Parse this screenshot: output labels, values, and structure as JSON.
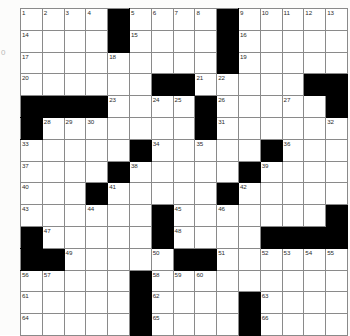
{
  "puzzle": {
    "title": "Crossword Puzzle Grid",
    "size": {
      "rows": 15,
      "cols": 15
    },
    "colors": {
      "block": "#000000",
      "cell": "#ffffff",
      "grid_line": "#8a8a8a",
      "number_text": "#2b2b2b",
      "page_background": "#fcfcfb"
    },
    "margin_note": "0",
    "grid": [
      [
        {
          "block": false,
          "num": "1"
        },
        {
          "block": false,
          "num": "2"
        },
        {
          "block": false,
          "num": "3"
        },
        {
          "block": false,
          "num": "4"
        },
        {
          "block": true,
          "num": ""
        },
        {
          "block": false,
          "num": "5"
        },
        {
          "block": false,
          "num": "6"
        },
        {
          "block": false,
          "num": "7"
        },
        {
          "block": false,
          "num": "8"
        },
        {
          "block": true,
          "num": ""
        },
        {
          "block": false,
          "num": "9"
        },
        {
          "block": false,
          "num": "10"
        },
        {
          "block": false,
          "num": "11"
        },
        {
          "block": false,
          "num": "12"
        },
        {
          "block": false,
          "num": "13"
        }
      ],
      [
        {
          "block": false,
          "num": "14"
        },
        {
          "block": false,
          "num": ""
        },
        {
          "block": false,
          "num": ""
        },
        {
          "block": false,
          "num": ""
        },
        {
          "block": true,
          "num": ""
        },
        {
          "block": false,
          "num": "15"
        },
        {
          "block": false,
          "num": ""
        },
        {
          "block": false,
          "num": ""
        },
        {
          "block": false,
          "num": ""
        },
        {
          "block": true,
          "num": ""
        },
        {
          "block": false,
          "num": "16"
        },
        {
          "block": false,
          "num": ""
        },
        {
          "block": false,
          "num": ""
        },
        {
          "block": false,
          "num": ""
        },
        {
          "block": false,
          "num": ""
        }
      ],
      [
        {
          "block": false,
          "num": "17"
        },
        {
          "block": false,
          "num": ""
        },
        {
          "block": false,
          "num": ""
        },
        {
          "block": false,
          "num": ""
        },
        {
          "block": false,
          "num": "18"
        },
        {
          "block": false,
          "num": ""
        },
        {
          "block": false,
          "num": ""
        },
        {
          "block": false,
          "num": ""
        },
        {
          "block": false,
          "num": ""
        },
        {
          "block": true,
          "num": ""
        },
        {
          "block": false,
          "num": "19"
        },
        {
          "block": false,
          "num": ""
        },
        {
          "block": false,
          "num": ""
        },
        {
          "block": false,
          "num": ""
        },
        {
          "block": false,
          "num": ""
        }
      ],
      [
        {
          "block": false,
          "num": "20"
        },
        {
          "block": false,
          "num": ""
        },
        {
          "block": false,
          "num": ""
        },
        {
          "block": false,
          "num": ""
        },
        {
          "block": false,
          "num": ""
        },
        {
          "block": false,
          "num": ""
        },
        {
          "block": true,
          "num": ""
        },
        {
          "block": true,
          "num": ""
        },
        {
          "block": false,
          "num": "21"
        },
        {
          "block": false,
          "num": "22"
        },
        {
          "block": false,
          "num": ""
        },
        {
          "block": false,
          "num": ""
        },
        {
          "block": false,
          "num": ""
        },
        {
          "block": true,
          "num": ""
        },
        {
          "block": true,
          "num": ""
        }
      ],
      [
        {
          "block": true,
          "num": ""
        },
        {
          "block": true,
          "num": ""
        },
        {
          "block": true,
          "num": ""
        },
        {
          "block": true,
          "num": ""
        },
        {
          "block": false,
          "num": "23"
        },
        {
          "block": false,
          "num": ""
        },
        {
          "block": false,
          "num": "24"
        },
        {
          "block": false,
          "num": "25"
        },
        {
          "block": true,
          "num": ""
        },
        {
          "block": false,
          "num": "26"
        },
        {
          "block": false,
          "num": ""
        },
        {
          "block": false,
          "num": ""
        },
        {
          "block": false,
          "num": "27"
        },
        {
          "block": false,
          "num": ""
        },
        {
          "block": true,
          "num": ""
        }
      ],
      [
        {
          "block": true,
          "num": ""
        },
        {
          "block": false,
          "num": "28"
        },
        {
          "block": false,
          "num": "29"
        },
        {
          "block": false,
          "num": "30"
        },
        {
          "block": false,
          "num": ""
        },
        {
          "block": false,
          "num": ""
        },
        {
          "block": false,
          "num": ""
        },
        {
          "block": false,
          "num": ""
        },
        {
          "block": true,
          "num": ""
        },
        {
          "block": false,
          "num": "31"
        },
        {
          "block": false,
          "num": ""
        },
        {
          "block": false,
          "num": ""
        },
        {
          "block": false,
          "num": ""
        },
        {
          "block": false,
          "num": ""
        },
        {
          "block": false,
          "num": "32"
        }
      ],
      [
        {
          "block": false,
          "num": "33"
        },
        {
          "block": false,
          "num": ""
        },
        {
          "block": false,
          "num": ""
        },
        {
          "block": false,
          "num": ""
        },
        {
          "block": false,
          "num": ""
        },
        {
          "block": true,
          "num": ""
        },
        {
          "block": false,
          "num": "34"
        },
        {
          "block": false,
          "num": ""
        },
        {
          "block": false,
          "num": "35"
        },
        {
          "block": false,
          "num": ""
        },
        {
          "block": false,
          "num": ""
        },
        {
          "block": true,
          "num": ""
        },
        {
          "block": false,
          "num": "36"
        },
        {
          "block": false,
          "num": ""
        },
        {
          "block": false,
          "num": ""
        }
      ],
      [
        {
          "block": false,
          "num": "37"
        },
        {
          "block": false,
          "num": ""
        },
        {
          "block": false,
          "num": ""
        },
        {
          "block": false,
          "num": ""
        },
        {
          "block": true,
          "num": ""
        },
        {
          "block": false,
          "num": "38"
        },
        {
          "block": false,
          "num": ""
        },
        {
          "block": false,
          "num": ""
        },
        {
          "block": false,
          "num": ""
        },
        {
          "block": false,
          "num": ""
        },
        {
          "block": true,
          "num": ""
        },
        {
          "block": false,
          "num": "39"
        },
        {
          "block": false,
          "num": ""
        },
        {
          "block": false,
          "num": ""
        },
        {
          "block": false,
          "num": ""
        }
      ],
      [
        {
          "block": false,
          "num": "40"
        },
        {
          "block": false,
          "num": ""
        },
        {
          "block": false,
          "num": ""
        },
        {
          "block": true,
          "num": ""
        },
        {
          "block": false,
          "num": "41"
        },
        {
          "block": false,
          "num": ""
        },
        {
          "block": false,
          "num": ""
        },
        {
          "block": false,
          "num": ""
        },
        {
          "block": false,
          "num": ""
        },
        {
          "block": true,
          "num": ""
        },
        {
          "block": false,
          "num": "42"
        },
        {
          "block": false,
          "num": ""
        },
        {
          "block": false,
          "num": ""
        },
        {
          "block": false,
          "num": ""
        },
        {
          "block": false,
          "num": ""
        }
      ],
      [
        {
          "block": false,
          "num": "43"
        },
        {
          "block": false,
          "num": ""
        },
        {
          "block": false,
          "num": ""
        },
        {
          "block": false,
          "num": "44"
        },
        {
          "block": false,
          "num": ""
        },
        {
          "block": false,
          "num": ""
        },
        {
          "block": true,
          "num": ""
        },
        {
          "block": false,
          "num": "45"
        },
        {
          "block": false,
          "num": ""
        },
        {
          "block": false,
          "num": "46"
        },
        {
          "block": false,
          "num": ""
        },
        {
          "block": false,
          "num": ""
        },
        {
          "block": false,
          "num": ""
        },
        {
          "block": false,
          "num": ""
        },
        {
          "block": true,
          "num": ""
        }
      ],
      [
        {
          "block": true,
          "num": ""
        },
        {
          "block": false,
          "num": "47"
        },
        {
          "block": false,
          "num": ""
        },
        {
          "block": false,
          "num": ""
        },
        {
          "block": false,
          "num": ""
        },
        {
          "block": false,
          "num": ""
        },
        {
          "block": true,
          "num": ""
        },
        {
          "block": false,
          "num": "48"
        },
        {
          "block": false,
          "num": ""
        },
        {
          "block": false,
          "num": ""
        },
        {
          "block": false,
          "num": ""
        },
        {
          "block": true,
          "num": ""
        },
        {
          "block": true,
          "num": ""
        },
        {
          "block": true,
          "num": ""
        },
        {
          "block": true,
          "num": ""
        }
      ],
      [
        {
          "block": true,
          "num": ""
        },
        {
          "block": true,
          "num": ""
        },
        {
          "block": false,
          "num": "49"
        },
        {
          "block": false,
          "num": ""
        },
        {
          "block": false,
          "num": ""
        },
        {
          "block": false,
          "num": ""
        },
        {
          "block": false,
          "num": "50"
        },
        {
          "block": true,
          "num": ""
        },
        {
          "block": true,
          "num": ""
        },
        {
          "block": false,
          "num": "51"
        },
        {
          "block": false,
          "num": ""
        },
        {
          "block": false,
          "num": "52"
        },
        {
          "block": false,
          "num": "53"
        },
        {
          "block": false,
          "num": "54"
        },
        {
          "block": false,
          "num": "55"
        }
      ],
      [
        {
          "block": false,
          "num": "56"
        },
        {
          "block": false,
          "num": "57"
        },
        {
          "block": false,
          "num": ""
        },
        {
          "block": false,
          "num": ""
        },
        {
          "block": false,
          "num": ""
        },
        {
          "block": true,
          "num": ""
        },
        {
          "block": false,
          "num": "58"
        },
        {
          "block": false,
          "num": "59"
        },
        {
          "block": false,
          "num": "60"
        },
        {
          "block": false,
          "num": ""
        },
        {
          "block": false,
          "num": ""
        },
        {
          "block": false,
          "num": ""
        },
        {
          "block": false,
          "num": ""
        },
        {
          "block": false,
          "num": ""
        },
        {
          "block": false,
          "num": ""
        }
      ],
      [
        {
          "block": false,
          "num": "61"
        },
        {
          "block": false,
          "num": ""
        },
        {
          "block": false,
          "num": ""
        },
        {
          "block": false,
          "num": ""
        },
        {
          "block": false,
          "num": ""
        },
        {
          "block": true,
          "num": ""
        },
        {
          "block": false,
          "num": "62"
        },
        {
          "block": false,
          "num": ""
        },
        {
          "block": false,
          "num": ""
        },
        {
          "block": false,
          "num": ""
        },
        {
          "block": true,
          "num": ""
        },
        {
          "block": false,
          "num": "63"
        },
        {
          "block": false,
          "num": ""
        },
        {
          "block": false,
          "num": ""
        },
        {
          "block": false,
          "num": ""
        }
      ],
      [
        {
          "block": false,
          "num": "64"
        },
        {
          "block": false,
          "num": ""
        },
        {
          "block": false,
          "num": ""
        },
        {
          "block": false,
          "num": ""
        },
        {
          "block": false,
          "num": ""
        },
        {
          "block": true,
          "num": ""
        },
        {
          "block": false,
          "num": "65"
        },
        {
          "block": false,
          "num": ""
        },
        {
          "block": false,
          "num": ""
        },
        {
          "block": false,
          "num": ""
        },
        {
          "block": true,
          "num": ""
        },
        {
          "block": false,
          "num": "66"
        },
        {
          "block": false,
          "num": ""
        },
        {
          "block": false,
          "num": ""
        },
        {
          "block": false,
          "num": ""
        }
      ]
    ]
  }
}
